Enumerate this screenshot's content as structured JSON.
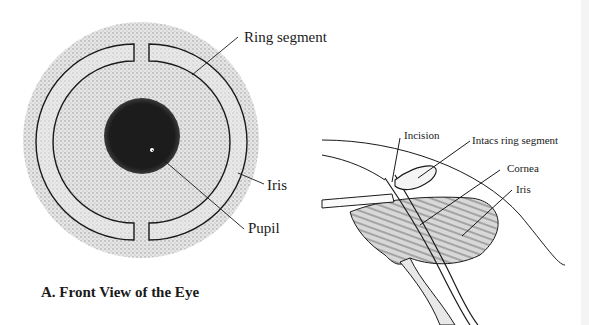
{
  "figure": {
    "caption": "A.  Front View of the Eye",
    "front_view": {
      "labels": {
        "ring_segment": "Ring segment",
        "iris": "Iris",
        "pupil": "Pupil"
      }
    },
    "side_view": {
      "labels": {
        "incision": "Incision",
        "intacs_ring_segment": "Intacs ring segment",
        "cornea": "Cornea",
        "iris": "Iris"
      }
    },
    "colors": {
      "line": "#1a1a1a",
      "stipple": "#b8b8b8",
      "pupil": "#1c1c1c",
      "background": "#ffffff"
    }
  }
}
